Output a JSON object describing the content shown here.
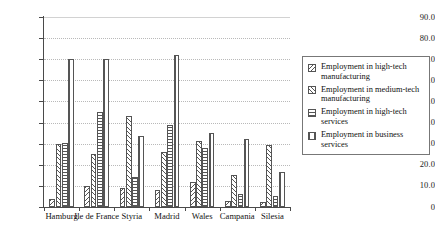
{
  "chart_data": {
    "type": "bar",
    "title": "",
    "subtitle": "",
    "xlabel": "",
    "ylabel": "",
    "ylim": [
      0,
      90
    ],
    "ytick_step": 10,
    "ytick_labels": [
      "90.0",
      "80.0",
      "70.0",
      "60.0",
      "50.0",
      "40.0",
      "30.0",
      "20.0",
      "10.0",
      "0"
    ],
    "grid": true,
    "grid_axis": "y",
    "legend_position": "right",
    "categories": [
      "Hamburg",
      "Ile de France",
      "Styria",
      "Madrid",
      "Wales",
      "Campania",
      "Silesia"
    ],
    "series": [
      {
        "name": "Employment in high-tech manufacturing",
        "pattern": "diagonal-backward",
        "values": [
          4.0,
          10.0,
          9.0,
          8.0,
          12.0,
          3.0,
          2.5
        ]
      },
      {
        "name": "Employment in medium-tech manufacturing",
        "pattern": "diagonal-forward",
        "values": [
          30.0,
          25.0,
          43.0,
          26.0,
          31.5,
          15.0,
          29.5
        ]
      },
      {
        "name": "Employment in high-tech services",
        "pattern": "horizontal-lines",
        "values": [
          30.5,
          45.0,
          14.0,
          39.0,
          28.0,
          6.0,
          5.0
        ]
      },
      {
        "name": "Employment in business services",
        "pattern": "vertical-lines",
        "values": [
          70.0,
          70.0,
          33.5,
          72.0,
          35.0,
          32.0,
          16.5
        ]
      }
    ]
  },
  "legend": {
    "items": [
      {
        "label": "Employment in high-tech manufacturing",
        "swatch": "diagonal-backward-swatch"
      },
      {
        "label": "Employment in medium-tech manufacturing",
        "swatch": "diagonal-forward-swatch"
      },
      {
        "label": "Employment in high-tech services",
        "swatch": "horizontal-lines-swatch"
      },
      {
        "label": "Employment in business services",
        "swatch": "vertical-lines-swatch"
      }
    ]
  },
  "axis": {
    "x_category_labels": [
      "Hamburg",
      "Ile de France",
      "Styria",
      "Madrid",
      "Wales",
      "Campania",
      "Silesia"
    ]
  },
  "colors": {
    "bar_stroke": "#555555",
    "bar_fill": "#ffffff",
    "axis": "#4a4a4a",
    "gridline": "#b9b9b9",
    "text": "#111111",
    "legend_border": "#777777",
    "background": "#ffffff"
  }
}
